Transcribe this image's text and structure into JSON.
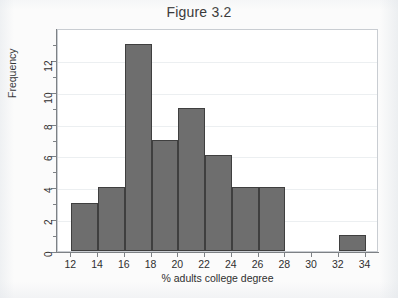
{
  "chart_data": {
    "type": "bar",
    "title": "Figure 3.2",
    "xlabel": "% adults college degree",
    "ylabel": "Frequency",
    "xlim": [
      11,
      35
    ],
    "ylim": [
      0,
      14
    ],
    "grid": true,
    "legend": null,
    "bin_width": 2,
    "xticks": [
      12,
      14,
      16,
      18,
      20,
      22,
      24,
      26,
      28,
      30,
      32,
      34
    ],
    "yticks": [
      0,
      2,
      4,
      6,
      8,
      10,
      12
    ],
    "bins": [
      {
        "start": 12,
        "end": 14,
        "value": 3
      },
      {
        "start": 14,
        "end": 16,
        "value": 4
      },
      {
        "start": 16,
        "end": 18,
        "value": 13
      },
      {
        "start": 18,
        "end": 20,
        "value": 7
      },
      {
        "start": 20,
        "end": 22,
        "value": 9
      },
      {
        "start": 22,
        "end": 24,
        "value": 6
      },
      {
        "start": 24,
        "end": 26,
        "value": 4
      },
      {
        "start": 26,
        "end": 28,
        "value": 4
      },
      {
        "start": 28,
        "end": 30,
        "value": 0
      },
      {
        "start": 30,
        "end": 32,
        "value": 0
      },
      {
        "start": 32,
        "end": 34,
        "value": 1
      }
    ],
    "categories": [
      "12-14",
      "14-16",
      "16-18",
      "18-20",
      "20-22",
      "22-24",
      "24-26",
      "26-28",
      "28-30",
      "30-32",
      "32-34"
    ],
    "values": [
      3,
      4,
      13,
      7,
      9,
      6,
      4,
      4,
      0,
      0,
      1
    ],
    "colors": {
      "bar_fill": "#6e6e6e",
      "bar_edge": "#3f3f3f",
      "plot_background": "#ffffff",
      "page_background": "#fbfbfb",
      "gridline": "#eceff1",
      "axis": "#7d8185",
      "text": "#2f2f2f"
    }
  }
}
